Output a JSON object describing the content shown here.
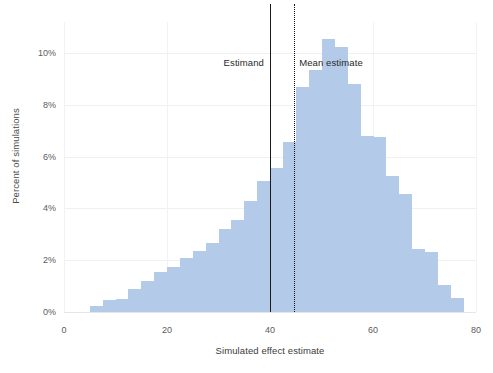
{
  "chart_data": {
    "type": "bar",
    "title": "",
    "subtitle": "",
    "xlabel": "Simulated effect estimate",
    "ylabel": "Percent of simulations",
    "xlim": [
      0,
      80
    ],
    "ylim": [
      0,
      11.2
    ],
    "xticks": [
      0,
      20,
      40,
      60,
      80
    ],
    "xtick_labels": [
      "0",
      "20",
      "40",
      "60",
      "80"
    ],
    "yticks": [
      0,
      2,
      4,
      6,
      8,
      10
    ],
    "ytick_labels": [
      "0%",
      "2%",
      "4%",
      "6%",
      "8%",
      "10%"
    ],
    "grid": true,
    "legend": "none",
    "bin_width": 2.5,
    "bar_color": "#b3cbe8",
    "categories": [
      "5.0",
      "7.5",
      "10.0",
      "12.5",
      "15.0",
      "17.5",
      "20.0",
      "22.5",
      "25.0",
      "27.5",
      "30.0",
      "32.5",
      "35.0",
      "37.5",
      "40.0",
      "42.5",
      "45.0",
      "47.5",
      "50.0",
      "52.5",
      "55.0",
      "57.5",
      "60.0",
      "62.5",
      "65.0",
      "67.5",
      "70.0",
      "72.5",
      "75.0"
    ],
    "values": [
      0.25,
      0.45,
      0.5,
      0.9,
      1.2,
      1.55,
      1.75,
      2.1,
      2.35,
      2.65,
      3.2,
      3.55,
      4.3,
      5.05,
      5.55,
      6.55,
      8.7,
      9.35,
      10.55,
      10.25,
      8.8,
      6.8,
      6.75,
      5.25,
      4.55,
      2.45,
      2.3,
      1.05,
      0.55
    ],
    "annotations": [
      {
        "name": "estimand",
        "label": "Estimand",
        "x": 40.0,
        "line_style": "solid",
        "color": "#1b1b1b",
        "label_side": "left"
      },
      {
        "name": "mean-estimate",
        "label": "Mean estimate",
        "x": 44.7,
        "line_style": "dotted",
        "color": "#101010",
        "label_side": "right"
      }
    ],
    "annotation_label_y_percent": 9.6
  },
  "caption": {
    "text": ""
  }
}
